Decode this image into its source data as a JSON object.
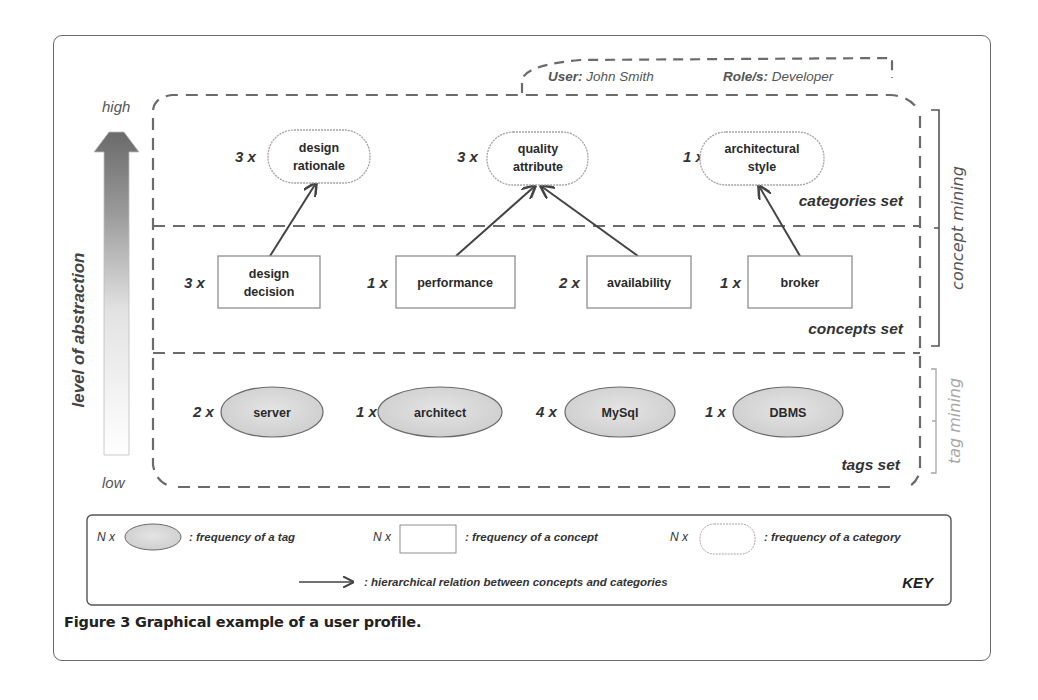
{
  "figure": {
    "caption": "Figure 3 Graphical example of a user profile."
  },
  "header": {
    "user_label": "User:",
    "user_value": " John Smith",
    "role_label": "Role/s:",
    "role_value": " Developer"
  },
  "axis": {
    "high": "high",
    "low": "low",
    "title": "level of abstraction"
  },
  "sections": {
    "categories_set": "categories set",
    "concepts_set": "concepts set",
    "tags_set": "tags set"
  },
  "brackets": {
    "concept_mining": "concept mining",
    "tag_mining": "tag mining"
  },
  "categories": [
    {
      "count": "3 x",
      "line1": "design",
      "line2": "rationale"
    },
    {
      "count": "3 x",
      "line1": "quality",
      "line2": "attribute"
    },
    {
      "count": "1 x",
      "line1": "architectural",
      "line2": "style"
    }
  ],
  "concepts": [
    {
      "count": "3 x",
      "line1": "design",
      "line2": "decision"
    },
    {
      "count": "1 x",
      "label": "performance"
    },
    {
      "count": "2 x",
      "label": "availability"
    },
    {
      "count": "1 x",
      "label": "broker"
    }
  ],
  "tags": [
    {
      "count": "2 x",
      "label": "server"
    },
    {
      "count": "1 x",
      "label": "architect"
    },
    {
      "count": "4 x",
      "label": "MySql"
    },
    {
      "count": "1 x",
      "label": "DBMS"
    }
  ],
  "relations": [
    {
      "from": "design decision",
      "to": "design rationale"
    },
    {
      "from": "performance",
      "to": "quality attribute"
    },
    {
      "from": "availability",
      "to": "quality attribute"
    },
    {
      "from": "broker",
      "to": "architectural style"
    }
  ],
  "key": {
    "title": "KEY",
    "n": "N x",
    "tag_desc": ": frequency of a tag",
    "concept_desc": ": frequency of a concept",
    "category_desc": ": frequency of a category",
    "relation_desc": ": hierarchical relation between concepts and categories"
  },
  "colors": {
    "dash": "#6b6b6b",
    "arrow": "#444444",
    "tag_fill": "#d6d6d6",
    "frame": "#6a6a6a"
  }
}
